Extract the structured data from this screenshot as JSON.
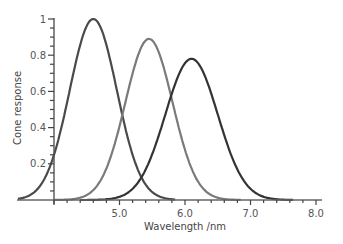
{
  "chart_data": {
    "type": "line",
    "title": "",
    "xlabel": "Wavelength /nm",
    "ylabel": "Cone response",
    "xlim": [
      4.0,
      8.0
    ],
    "ylim": [
      0,
      1
    ],
    "x_ticks": [
      {
        "value": 5.0,
        "label": "5.0"
      },
      {
        "value": 6.0,
        "label": "6.0"
      },
      {
        "value": 7.0,
        "label": "7.0"
      },
      {
        "value": 8.0,
        "label": "8.0"
      }
    ],
    "y_ticks": [
      {
        "value": 0.2,
        "label": "0.2"
      },
      {
        "value": 0.4,
        "label": "0.4"
      },
      {
        "value": 0.6,
        "label": "0.6"
      },
      {
        "value": 0.8,
        "label": "0.8"
      },
      {
        "value": 1.0,
        "label": "1"
      }
    ],
    "grid": false,
    "legend": "none",
    "series": [
      {
        "name": "S cone",
        "peak_x": 4.6,
        "peak_y": 1.0,
        "width": 0.36,
        "x_start": 3.45,
        "x_end": 5.85,
        "color": "#4a4a4a"
      },
      {
        "name": "M cone",
        "peak_x": 5.45,
        "peak_y": 0.89,
        "width": 0.36,
        "x_start": 4.0,
        "x_end": 6.85,
        "color": "#7a7a7a"
      },
      {
        "name": "L cone",
        "peak_x": 6.1,
        "peak_y": 0.78,
        "width": 0.4,
        "x_start": 4.4,
        "x_end": 7.65,
        "color": "#333333"
      }
    ]
  }
}
